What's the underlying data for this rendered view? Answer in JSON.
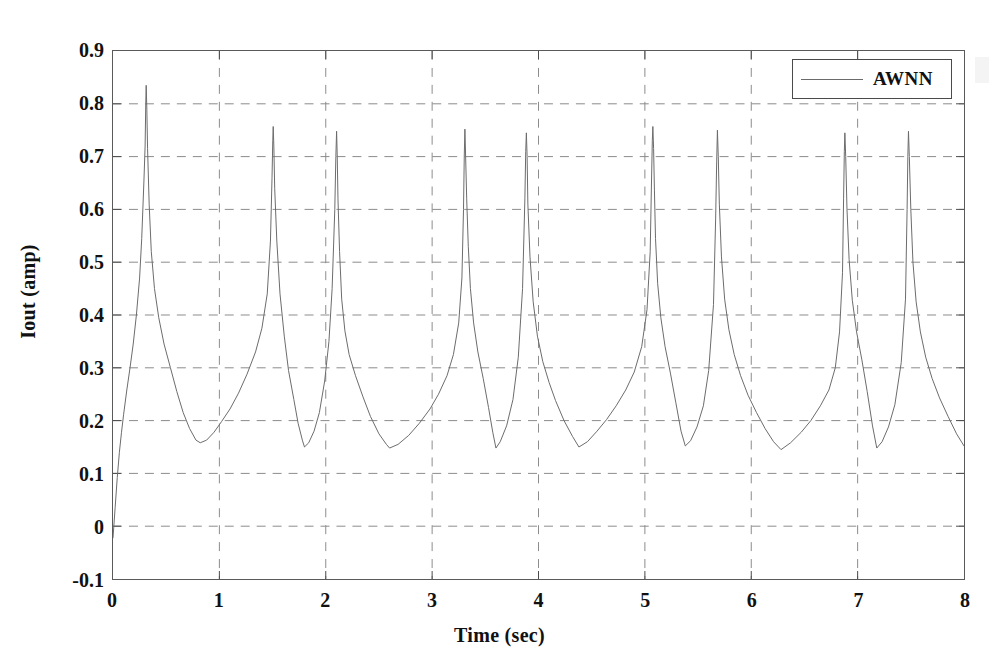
{
  "chart_data": {
    "type": "line",
    "title": "",
    "xlabel": "Time (sec)",
    "ylabel": "Iout (amp)",
    "xlim": [
      0,
      8
    ],
    "ylim": [
      -0.1,
      0.9
    ],
    "xticks": [
      "0",
      "1",
      "2",
      "3",
      "4",
      "5",
      "6",
      "7",
      "8"
    ],
    "xtick_values": [
      0,
      1,
      2,
      3,
      4,
      5,
      6,
      7,
      8
    ],
    "yticks": [
      "-0.1",
      "0",
      "0.1",
      "0.2",
      "0.3",
      "0.4",
      "0.5",
      "0.6",
      "0.7",
      "0.8",
      "0.9"
    ],
    "ytick_values": [
      -0.1,
      0,
      0.1,
      0.2,
      0.3,
      0.4,
      0.5,
      0.6,
      0.7,
      0.8,
      0.9
    ],
    "grid": true,
    "grid_style": "dashed",
    "grid_color": "#8c8c8c",
    "line_color": "#6b6b6b",
    "line_width": 1.0,
    "legend": {
      "position": "top-right",
      "entries": [
        {
          "name": "AWNN",
          "color": "#6b6b6b",
          "style": "solid"
        }
      ]
    },
    "annotations": [],
    "series": [
      {
        "name": "AWNN",
        "peaks": [
          {
            "t": 0.31,
            "value": 0.835
          },
          {
            "t": 1.5,
            "value": 0.757
          },
          {
            "t": 2.1,
            "value": 0.748
          },
          {
            "t": 3.3,
            "value": 0.752
          },
          {
            "t": 3.88,
            "value": 0.745
          },
          {
            "t": 5.07,
            "value": 0.757
          },
          {
            "t": 5.68,
            "value": 0.75
          },
          {
            "t": 6.87,
            "value": 0.745
          },
          {
            "t": 7.47,
            "value": 0.748
          }
        ],
        "minima": [
          {
            "t": 0.82,
            "value": 0.158
          },
          {
            "t": 1.8,
            "value": 0.15
          },
          {
            "t": 2.6,
            "value": 0.148
          },
          {
            "t": 3.6,
            "value": 0.148
          },
          {
            "t": 4.38,
            "value": 0.15
          },
          {
            "t": 5.38,
            "value": 0.152
          },
          {
            "t": 6.28,
            "value": 0.145
          },
          {
            "t": 7.18,
            "value": 0.148
          }
        ],
        "start_point": {
          "t": 0.0,
          "value": -0.022
        },
        "end_point": {
          "t": 8.0,
          "value": 0.152
        },
        "points": [
          [
            0.0,
            -0.022
          ],
          [
            0.02,
            0.035
          ],
          [
            0.04,
            0.092
          ],
          [
            0.06,
            0.14
          ],
          [
            0.08,
            0.178
          ],
          [
            0.1,
            0.212
          ],
          [
            0.13,
            0.258
          ],
          [
            0.16,
            0.3
          ],
          [
            0.19,
            0.345
          ],
          [
            0.22,
            0.4
          ],
          [
            0.25,
            0.47
          ],
          [
            0.27,
            0.545
          ],
          [
            0.29,
            0.65
          ],
          [
            0.302,
            0.72
          ],
          [
            0.308,
            0.8
          ],
          [
            0.312,
            0.835
          ],
          [
            0.318,
            0.79
          ],
          [
            0.325,
            0.715
          ],
          [
            0.34,
            0.61
          ],
          [
            0.36,
            0.52
          ],
          [
            0.39,
            0.45
          ],
          [
            0.43,
            0.395
          ],
          [
            0.48,
            0.345
          ],
          [
            0.54,
            0.3
          ],
          [
            0.6,
            0.255
          ],
          [
            0.66,
            0.215
          ],
          [
            0.72,
            0.185
          ],
          [
            0.78,
            0.163
          ],
          [
            0.82,
            0.158
          ],
          [
            0.88,
            0.163
          ],
          [
            0.95,
            0.178
          ],
          [
            1.02,
            0.198
          ],
          [
            1.1,
            0.222
          ],
          [
            1.18,
            0.252
          ],
          [
            1.26,
            0.288
          ],
          [
            1.34,
            0.33
          ],
          [
            1.4,
            0.375
          ],
          [
            1.45,
            0.44
          ],
          [
            1.48,
            0.54
          ],
          [
            1.495,
            0.66
          ],
          [
            1.502,
            0.73
          ],
          [
            1.506,
            0.757
          ],
          [
            1.512,
            0.72
          ],
          [
            1.52,
            0.64
          ],
          [
            1.54,
            0.54
          ],
          [
            1.57,
            0.44
          ],
          [
            1.61,
            0.36
          ],
          [
            1.65,
            0.295
          ],
          [
            1.7,
            0.24
          ],
          [
            1.74,
            0.195
          ],
          [
            1.78,
            0.163
          ],
          [
            1.8,
            0.15
          ],
          [
            1.84,
            0.158
          ],
          [
            1.89,
            0.18
          ],
          [
            1.94,
            0.215
          ],
          [
            1.99,
            0.275
          ],
          [
            2.03,
            0.35
          ],
          [
            2.06,
            0.45
          ],
          [
            2.085,
            0.6
          ],
          [
            2.095,
            0.7
          ],
          [
            2.102,
            0.748
          ],
          [
            2.108,
            0.7
          ],
          [
            2.115,
            0.62
          ],
          [
            2.13,
            0.52
          ],
          [
            2.15,
            0.43
          ],
          [
            2.18,
            0.37
          ],
          [
            2.22,
            0.325
          ],
          [
            2.28,
            0.285
          ],
          [
            2.35,
            0.245
          ],
          [
            2.42,
            0.208
          ],
          [
            2.5,
            0.175
          ],
          [
            2.57,
            0.155
          ],
          [
            2.6,
            0.148
          ],
          [
            2.68,
            0.155
          ],
          [
            2.78,
            0.172
          ],
          [
            2.88,
            0.195
          ],
          [
            2.98,
            0.222
          ],
          [
            3.06,
            0.25
          ],
          [
            3.14,
            0.285
          ],
          [
            3.2,
            0.325
          ],
          [
            3.25,
            0.385
          ],
          [
            3.28,
            0.47
          ],
          [
            3.295,
            0.6
          ],
          [
            3.302,
            0.7
          ],
          [
            3.308,
            0.752
          ],
          [
            3.315,
            0.7
          ],
          [
            3.325,
            0.62
          ],
          [
            3.34,
            0.53
          ],
          [
            3.36,
            0.45
          ],
          [
            3.39,
            0.385
          ],
          [
            3.43,
            0.33
          ],
          [
            3.48,
            0.28
          ],
          [
            3.53,
            0.225
          ],
          [
            3.57,
            0.178
          ],
          [
            3.6,
            0.148
          ],
          [
            3.64,
            0.16
          ],
          [
            3.7,
            0.19
          ],
          [
            3.76,
            0.24
          ],
          [
            3.81,
            0.32
          ],
          [
            3.85,
            0.45
          ],
          [
            3.872,
            0.62
          ],
          [
            3.88,
            0.71
          ],
          [
            3.886,
            0.745
          ],
          [
            3.893,
            0.7
          ],
          [
            3.9,
            0.61
          ],
          [
            3.92,
            0.51
          ],
          [
            3.95,
            0.425
          ],
          [
            3.99,
            0.36
          ],
          [
            4.04,
            0.312
          ],
          [
            4.1,
            0.272
          ],
          [
            4.16,
            0.238
          ],
          [
            4.24,
            0.2
          ],
          [
            4.32,
            0.17
          ],
          [
            4.38,
            0.15
          ],
          [
            4.46,
            0.16
          ],
          [
            4.55,
            0.18
          ],
          [
            4.64,
            0.202
          ],
          [
            4.73,
            0.228
          ],
          [
            4.82,
            0.258
          ],
          [
            4.9,
            0.292
          ],
          [
            4.97,
            0.34
          ],
          [
            5.02,
            0.41
          ],
          [
            5.05,
            0.52
          ],
          [
            5.062,
            0.65
          ],
          [
            5.07,
            0.73
          ],
          [
            5.075,
            0.757
          ],
          [
            5.082,
            0.715
          ],
          [
            5.09,
            0.635
          ],
          [
            5.1,
            0.545
          ],
          [
            5.12,
            0.46
          ],
          [
            5.15,
            0.395
          ],
          [
            5.19,
            0.34
          ],
          [
            5.24,
            0.29
          ],
          [
            5.29,
            0.235
          ],
          [
            5.34,
            0.18
          ],
          [
            5.38,
            0.152
          ],
          [
            5.43,
            0.162
          ],
          [
            5.49,
            0.188
          ],
          [
            5.55,
            0.228
          ],
          [
            5.6,
            0.295
          ],
          [
            5.645,
            0.42
          ],
          [
            5.665,
            0.58
          ],
          [
            5.675,
            0.69
          ],
          [
            5.682,
            0.75
          ],
          [
            5.69,
            0.7
          ],
          [
            5.7,
            0.61
          ],
          [
            5.72,
            0.51
          ],
          [
            5.75,
            0.43
          ],
          [
            5.79,
            0.372
          ],
          [
            5.84,
            0.325
          ],
          [
            5.9,
            0.285
          ],
          [
            5.97,
            0.248
          ],
          [
            6.05,
            0.215
          ],
          [
            6.13,
            0.185
          ],
          [
            6.21,
            0.16
          ],
          [
            6.28,
            0.145
          ],
          [
            6.37,
            0.158
          ],
          [
            6.47,
            0.178
          ],
          [
            6.56,
            0.2
          ],
          [
            6.65,
            0.228
          ],
          [
            6.73,
            0.258
          ],
          [
            6.79,
            0.3
          ],
          [
            6.83,
            0.368
          ],
          [
            6.858,
            0.48
          ],
          [
            6.868,
            0.62
          ],
          [
            6.875,
            0.71
          ],
          [
            6.88,
            0.745
          ],
          [
            6.888,
            0.7
          ],
          [
            6.9,
            0.6
          ],
          [
            6.92,
            0.505
          ],
          [
            6.95,
            0.428
          ],
          [
            6.99,
            0.368
          ],
          [
            7.04,
            0.315
          ],
          [
            7.09,
            0.255
          ],
          [
            7.14,
            0.19
          ],
          [
            7.18,
            0.148
          ],
          [
            7.23,
            0.16
          ],
          [
            7.29,
            0.188
          ],
          [
            7.35,
            0.23
          ],
          [
            7.41,
            0.31
          ],
          [
            7.45,
            0.43
          ],
          [
            7.465,
            0.6
          ],
          [
            7.472,
            0.7
          ],
          [
            7.478,
            0.748
          ],
          [
            7.486,
            0.7
          ],
          [
            7.5,
            0.6
          ],
          [
            7.52,
            0.5
          ],
          [
            7.55,
            0.425
          ],
          [
            7.59,
            0.368
          ],
          [
            7.64,
            0.32
          ],
          [
            7.7,
            0.28
          ],
          [
            7.77,
            0.243
          ],
          [
            7.85,
            0.208
          ],
          [
            7.93,
            0.175
          ],
          [
            8.0,
            0.152
          ]
        ]
      }
    ]
  },
  "legend": {
    "label": "AWNN"
  },
  "axes": {
    "x_title": "Time (sec)",
    "y_title": "Iout (amp)"
  }
}
